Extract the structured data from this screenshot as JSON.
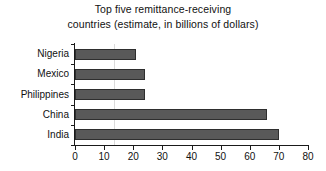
{
  "chart_data": {
    "type": "bar",
    "orientation": "horizontal",
    "title": "Top five remittance-receiving countries (estimate, in billions of dollars)",
    "title_lines": [
      "Top five remittance-receiving",
      "countries (estimate, in billions of dollars)"
    ],
    "xlabel": "",
    "ylabel": "",
    "categories": [
      "Nigeria",
      "Mexico",
      "Philippines",
      "China",
      "India"
    ],
    "values": [
      21,
      24,
      24,
      66,
      70
    ],
    "xlim": [
      0,
      80
    ],
    "xticks": [
      0,
      10,
      20,
      30,
      40,
      50,
      60,
      70,
      80
    ],
    "xtick_labels": [
      "0",
      "10",
      "20",
      "30",
      "40",
      "50",
      "60",
      "70",
      "80"
    ],
    "grid": false,
    "legend": false,
    "units": "billions of dollars",
    "bar_color": "#595959",
    "bar_edge_color": "#2e2e2e",
    "axis_color": "#1a1a1a",
    "background_color": "#ffffff"
  }
}
